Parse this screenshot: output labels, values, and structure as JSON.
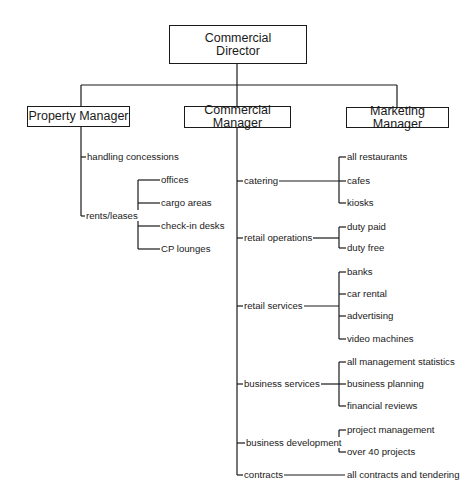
{
  "org_chart": {
    "director": {
      "label_line1": "Commercial",
      "label_line2": "Director"
    },
    "managers": [
      {
        "label": "Property Manager"
      },
      {
        "label": "Commercial Manager"
      },
      {
        "label": "Marketing Manager"
      }
    ],
    "property": {
      "items": [
        {
          "label": "handling concessions",
          "children": []
        },
        {
          "label": "rents/leases",
          "children": [
            "offices",
            "cargo areas",
            "check-in desks",
            "CP lounges"
          ]
        }
      ]
    },
    "commercial": {
      "items": [
        {
          "label": "catering",
          "children": [
            "all restaurants",
            "cafes",
            "kiosks"
          ]
        },
        {
          "label": "retail operations",
          "children": [
            "duty paid",
            "duty free"
          ]
        },
        {
          "label": "retail services",
          "children": [
            "banks",
            "car rental",
            "advertising",
            "video machines"
          ]
        },
        {
          "label": "business services",
          "children": [
            "all management statistics",
            "business planning",
            "financial reviews"
          ]
        },
        {
          "label": "business development",
          "children": [
            "project management",
            "over 40 projects"
          ]
        },
        {
          "label": "contracts",
          "children": [
            "all contracts and tendering"
          ]
        }
      ]
    },
    "marketing": {
      "items": []
    }
  }
}
